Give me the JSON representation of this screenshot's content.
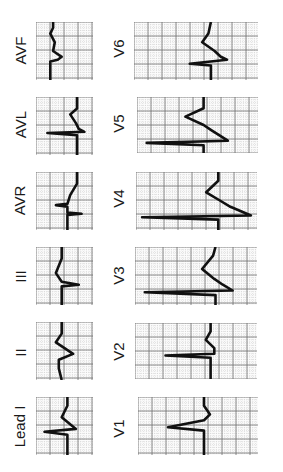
{
  "figure": {
    "colors": {
      "background": "#ffffff",
      "grid_minor": "#c8c8c8",
      "grid_major": "#707070",
      "trace": "#111111",
      "text": "#1a1a1a"
    }
  },
  "leads": [
    {
      "name": "AVF",
      "label": "AVF",
      "column": 1,
      "x": 36,
      "y": 22,
      "w": 57,
      "h": 58,
      "label_x": 20,
      "label_y": 50
    },
    {
      "name": "AVL",
      "label": "AVL",
      "column": 1,
      "x": 36,
      "y": 97,
      "w": 57,
      "h": 58,
      "label_x": 20,
      "label_y": 124
    },
    {
      "name": "AVR",
      "label": "AVR",
      "column": 1,
      "x": 36,
      "y": 172,
      "w": 57,
      "h": 58,
      "label_x": 20,
      "label_y": 200
    },
    {
      "name": "III",
      "label": "III",
      "column": 1,
      "x": 36,
      "y": 247,
      "w": 57,
      "h": 58,
      "label_x": 20,
      "label_y": 276
    },
    {
      "name": "II",
      "label": "II",
      "column": 1,
      "x": 36,
      "y": 322,
      "w": 57,
      "h": 58,
      "label_x": 20,
      "label_y": 352
    },
    {
      "name": "I",
      "label": "Lead I",
      "column": 1,
      "x": 36,
      "y": 397,
      "w": 57,
      "h": 58,
      "label_x": 20,
      "label_y": 426
    },
    {
      "name": "V6",
      "label": "V6",
      "column": 2,
      "x": 134,
      "y": 22,
      "w": 124,
      "h": 58,
      "label_x": 118,
      "label_y": 48
    },
    {
      "name": "V5",
      "label": "V5",
      "column": 2,
      "x": 137,
      "y": 97,
      "w": 121,
      "h": 56,
      "label_x": 118,
      "label_y": 123
    },
    {
      "name": "V4",
      "label": "V4",
      "column": 2,
      "x": 136,
      "y": 172,
      "w": 121,
      "h": 58,
      "label_x": 118,
      "label_y": 198
    },
    {
      "name": "V3",
      "label": "V3",
      "column": 2,
      "x": 135,
      "y": 247,
      "w": 122,
      "h": 58,
      "label_x": 118,
      "label_y": 275
    },
    {
      "name": "V2",
      "label": "V2",
      "column": 2,
      "x": 135,
      "y": 323,
      "w": 122,
      "h": 56,
      "label_x": 118,
      "label_y": 351
    },
    {
      "name": "V1",
      "label": "V1",
      "column": 2,
      "x": 138,
      "y": 397,
      "w": 120,
      "h": 58,
      "label_x": 118,
      "label_y": 428
    }
  ]
}
